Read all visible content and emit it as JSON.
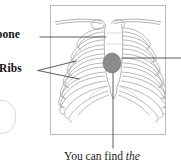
{
  "figure": {
    "type": "anatomical-diagram",
    "frame": {
      "x": 50,
      "y": 5,
      "width": 116,
      "height": 130,
      "border_color": "#b9b9b9",
      "background": "#ffffff"
    }
  },
  "labels": {
    "breastbone": "tbone",
    "ribs": "Ribs"
  },
  "caption": {
    "text": "You can find ",
    "italic_text": "the"
  },
  "colors": {
    "bone_outline": "#9a9a9a",
    "bone_fill": "#ffffff",
    "heart_fill": "#8c8c8c",
    "heart_stroke": "#6f6f6f",
    "leader_line": "#4a4a4a",
    "frame_border": "#b9b9b9",
    "text": "#111111"
  },
  "callouts": [
    {
      "name": "breastbone-leader",
      "from_x": 40,
      "from_y": 37,
      "to_x": 106,
      "to_y": 37
    },
    {
      "name": "ribs-leader-upper",
      "from_x": 38,
      "from_y": 70,
      "to_x": 76,
      "to_y": 61
    },
    {
      "name": "ribs-leader-lower",
      "from_x": 38,
      "from_y": 70,
      "to_x": 79,
      "to_y": 79
    },
    {
      "name": "heart-leader-right",
      "from_x": 122,
      "from_y": 58,
      "to_x": 181,
      "to_y": 58
    },
    {
      "name": "heart-leader-down",
      "from_x": 113,
      "from_y": 72,
      "to_x": 113,
      "to_y": 148
    }
  ],
  "anatomy": {
    "heart": {
      "cx": 112,
      "cy": 63,
      "rx": 9,
      "ry": 10
    },
    "rib_pairs": 9,
    "parts": [
      "clavicle",
      "sternum",
      "ribs",
      "xiphoid-process",
      "heart"
    ]
  }
}
